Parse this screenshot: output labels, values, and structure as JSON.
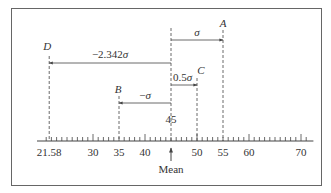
{
  "diagram": {
    "type": "number-line-z-score",
    "frame": true,
    "axis": {
      "min": 20,
      "max": 72,
      "minor_step": 1,
      "major_ticks": [
        30,
        40,
        50,
        60,
        70
      ],
      "tick_labels": [
        {
          "value": 21.58,
          "text": "21.58"
        },
        {
          "value": 30,
          "text": "30"
        },
        {
          "value": 35,
          "text": "35"
        },
        {
          "value": 40,
          "text": "40"
        },
        {
          "value": 50,
          "text": "50"
        },
        {
          "value": 55,
          "text": "55"
        },
        {
          "value": 60,
          "text": "60"
        },
        {
          "value": 70,
          "text": "70"
        }
      ]
    },
    "mean": {
      "value": 45,
      "value_label": "45",
      "label": "Mean"
    },
    "points": [
      {
        "name": "A",
        "value": 55,
        "offset_label": "σ",
        "offset_prefix": "",
        "direction": "right",
        "arrow_y": 40,
        "top_y": 30,
        "label_y": 27
      },
      {
        "name": "C",
        "value": 50,
        "offset_label": "σ",
        "offset_prefix": "0.5",
        "direction": "right",
        "arrow_y": 85,
        "top_y": 78,
        "label_y": 74
      },
      {
        "name": "B",
        "value": 35,
        "offset_label": "σ",
        "offset_prefix": "−",
        "direction": "left",
        "arrow_y": 103,
        "top_y": 96,
        "label_y": 93
      },
      {
        "name": "D",
        "value": 21.58,
        "offset_label": "σ",
        "offset_prefix": "−2.342",
        "direction": "left",
        "arrow_y": 63,
        "top_y": 56,
        "label_y": 50
      }
    ],
    "colors": {
      "line": "#444444",
      "frame": "#666666",
      "text": "#333333"
    }
  }
}
